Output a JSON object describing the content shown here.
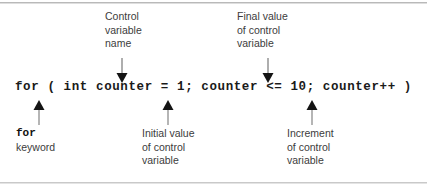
{
  "figure": {
    "kind": "annotated-code-diagram",
    "background_color": "#ffffff",
    "rule_color": "#b9b9b9",
    "text_color": "#3c3c3c",
    "code_color": "#1a1a1a",
    "arrow_color": "#8a8a8a",
    "arrow_head_color": "#111111"
  },
  "code": {
    "line": "for ( int counter = 1; counter <= 10; counter++ )",
    "tokens": {
      "keyword": "for",
      "open_paren": "(",
      "type": "int",
      "variable": "counter",
      "assign": "=",
      "initial_value": "1",
      "semicolon_1": ";",
      "condition_variable": "counter",
      "relational_operator": "<=",
      "final_value": "10",
      "semicolon_2": ";",
      "increment": "counter++",
      "close_paren": ")"
    }
  },
  "annotations": {
    "top": [
      {
        "id": "control-variable-name",
        "text": "Control\nvariable\nname",
        "lines": [
          "Control",
          "variable",
          "name"
        ],
        "points_to": "counter",
        "direction": "down"
      },
      {
        "id": "final-value-of-control-variable",
        "text": "Final value\nof control\nvariable",
        "lines": [
          "Final value",
          "of control",
          "variable"
        ],
        "points_to": "10",
        "direction": "down"
      }
    ],
    "bottom": [
      {
        "id": "for-keyword",
        "keyword": "for",
        "text": "keyword",
        "lines": [
          "for",
          "keyword"
        ],
        "points_to": "for",
        "direction": "up"
      },
      {
        "id": "initial-value-of-control-variable",
        "text": "Initial value\nof control\nvariable",
        "lines": [
          "Initial value",
          "of control",
          "variable"
        ],
        "points_to": "1",
        "direction": "up"
      },
      {
        "id": "increment-of-control-variable",
        "text": "Increment\nof control\nvariable",
        "lines": [
          "Increment",
          "of control",
          "variable"
        ],
        "points_to": "counter++",
        "direction": "up"
      }
    ]
  }
}
